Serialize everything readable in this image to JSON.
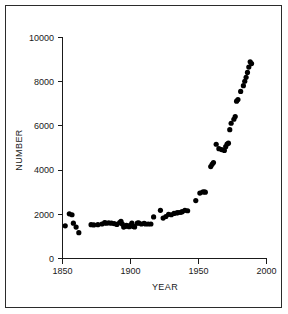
{
  "figure": {
    "border_color": "#2b2b2b",
    "background_color": "#ffffff"
  },
  "chart_data": {
    "type": "scatter",
    "title": "",
    "xlabel": "YEAR",
    "ylabel": "NUMBER",
    "xlim": [
      1850,
      2000
    ],
    "ylim": [
      0,
      10000
    ],
    "xticks": [
      1850,
      1900,
      1950,
      2000
    ],
    "xtick_labels": [
      "1850",
      "1900",
      "1950",
      "2000"
    ],
    "yticks": [
      0,
      2000,
      4000,
      6000,
      8000,
      10000
    ],
    "ytick_labels": [
      "0",
      "2000",
      "4000",
      "6000",
      "8000",
      "10000"
    ],
    "grid": false,
    "legend": false,
    "marker": "filled-circle",
    "marker_color": "#000000",
    "marker_size_px": 2.6,
    "series": [
      {
        "name": "number",
        "x": [
          1852,
          1855,
          1857,
          1858,
          1860,
          1862,
          1871,
          1873,
          1876,
          1879,
          1881,
          1882,
          1884,
          1886,
          1888,
          1890,
          1892,
          1893,
          1894,
          1895,
          1896,
          1897,
          1898,
          1899,
          1900,
          1901,
          1902,
          1903,
          1905,
          1906,
          1908,
          1910,
          1911,
          1913,
          1915,
          1917,
          1922,
          1924,
          1926,
          1928,
          1930,
          1932,
          1934,
          1935,
          1937,
          1938,
          1940,
          1942,
          1948,
          1951,
          1953,
          1954,
          1955,
          1959,
          1960,
          1961,
          1963,
          1965,
          1967,
          1969,
          1970,
          1971,
          1972,
          1973,
          1974,
          1976,
          1977,
          1978,
          1979,
          1981,
          1983,
          1984,
          1985,
          1986,
          1987,
          1988,
          1989
        ],
        "y": [
          1480,
          2020,
          1980,
          1600,
          1420,
          1170,
          1530,
          1520,
          1530,
          1560,
          1620,
          1600,
          1610,
          1600,
          1580,
          1540,
          1620,
          1680,
          1560,
          1420,
          1450,
          1500,
          1470,
          1440,
          1510,
          1600,
          1450,
          1430,
          1600,
          1610,
          1560,
          1590,
          1560,
          1560,
          1560,
          1880,
          2180,
          1830,
          1900,
          2000,
          1980,
          2040,
          2060,
          2080,
          2090,
          2120,
          2180,
          2160,
          2620,
          2960,
          3010,
          3020,
          3000,
          4160,
          4260,
          4340,
          5170,
          4970,
          4930,
          4890,
          5060,
          5180,
          5220,
          5830,
          6120,
          6300,
          6420,
          7120,
          7190,
          7560,
          7820,
          8020,
          8200,
          8420,
          8660,
          8900,
          8820
        ]
      }
    ]
  }
}
